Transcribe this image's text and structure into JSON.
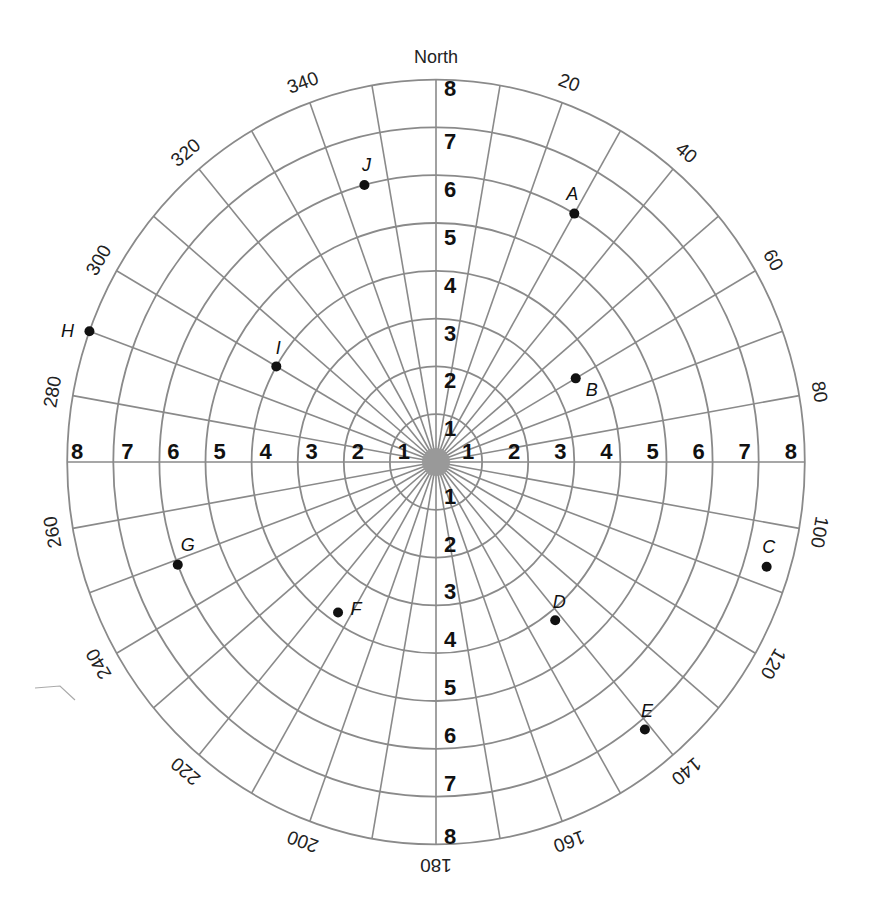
{
  "title": "North",
  "chart_data": {
    "type": "polar_grid",
    "title": "North",
    "center": [
      436,
      462
    ],
    "radius_unit_px": [
      46.1,
      47.8
    ],
    "rings": [
      1,
      2,
      3,
      4,
      5,
      6,
      7,
      8
    ],
    "spoke_step_deg": 10,
    "angle_labels": [
      20,
      40,
      60,
      80,
      100,
      120,
      140,
      160,
      180,
      200,
      220,
      240,
      260,
      280,
      300,
      320,
      340
    ],
    "axis_numbers": {
      "north": [
        "1",
        "2",
        "3",
        "4",
        "5",
        "6",
        "7",
        "8"
      ],
      "south": [
        "1",
        "2",
        "3",
        "4",
        "5",
        "6",
        "7",
        "8"
      ],
      "east": [
        "1",
        "2",
        "3",
        "4",
        "5",
        "6",
        "7",
        "8"
      ],
      "west": [
        "1",
        "2",
        "3",
        "4",
        "5",
        "6",
        "7",
        "8"
      ]
    },
    "points": [
      {
        "label": "A",
        "r": 6,
        "theta": 30
      },
      {
        "label": "B",
        "r": 3.5,
        "theta": 60
      },
      {
        "label": "C",
        "r": 7.5,
        "theta": 107
      },
      {
        "label": "D",
        "r": 4.2,
        "theta": 142
      },
      {
        "label": "E",
        "r": 7.2,
        "theta": 141
      },
      {
        "label": "F",
        "r": 3.8,
        "theta": 214
      },
      {
        "label": "G",
        "r": 6,
        "theta": 249
      },
      {
        "label": "H",
        "r": 8,
        "theta": 290
      },
      {
        "label": "I",
        "r": 4,
        "theta": 300
      },
      {
        "label": "J",
        "r": 6,
        "theta": 345
      }
    ],
    "colors": {
      "grid": "#8a8a8a",
      "text": "#111111"
    }
  }
}
